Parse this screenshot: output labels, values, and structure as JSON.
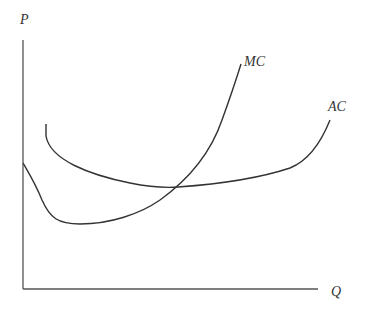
{
  "diagram": {
    "axes": {
      "y_label": "P",
      "x_label": "Q"
    },
    "curves": [
      {
        "name": "MC",
        "label": "MC",
        "description": "U-shaped marginal cost curve starting high at the vertical axis, falling to a minimum, then rising steeply"
      },
      {
        "name": "AC",
        "label": "AC",
        "description": "U-shaped average cost curve, flatter, with MC crossing it at its minimum"
      }
    ],
    "colors": {
      "line": "#333333",
      "axis": "#555555",
      "background": "#ffffff"
    }
  }
}
